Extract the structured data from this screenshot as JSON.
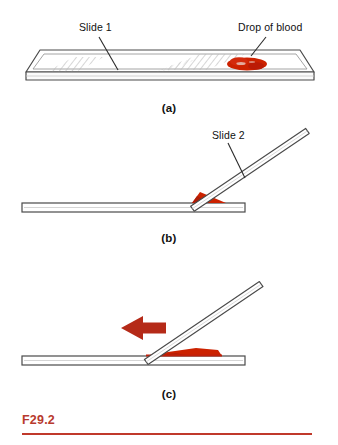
{
  "figure": {
    "number": "F29.2",
    "accent_color": "#b83a2e",
    "rule_color": "#c0392b",
    "blood_color": "#cc2200",
    "blood_dark_color": "#b02010",
    "arrow_color": "#b52a18",
    "line_color": "#3a3a3a",
    "hatch_color": "#b5b5b5",
    "background_color": "#ffffff",
    "panels": [
      {
        "id": "a",
        "label": "(a)",
        "description": "Glass microscope slide shown in perspective with a drop of blood near the right end",
        "callouts": [
          {
            "name": "slide-1",
            "text": "Slide 1"
          },
          {
            "name": "drop-of-blood",
            "text": "Drop of blood"
          }
        ]
      },
      {
        "id": "b",
        "label": "(b)",
        "description": "Second slide held at an angle, touching the drop which spreads along the contact edge",
        "callouts": [
          {
            "name": "slide-2",
            "text": "Slide 2"
          }
        ]
      },
      {
        "id": "c",
        "label": "(c)",
        "description": "Angled slide pushed to the left drawing the blood into a thin smear",
        "callouts": []
      }
    ]
  }
}
